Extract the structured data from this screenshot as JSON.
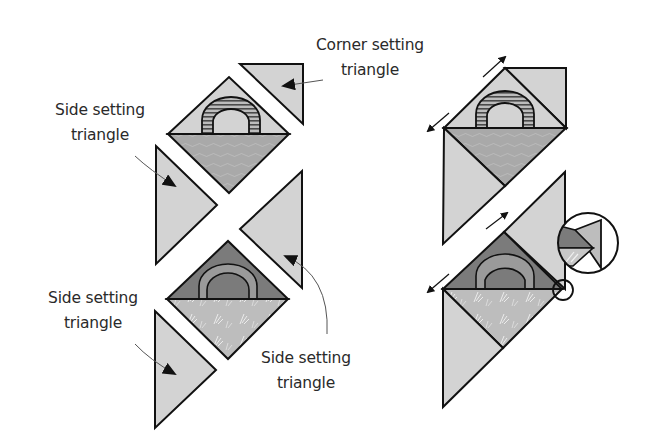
{
  "diagram": {
    "type": "quilt-assembly",
    "colors": {
      "setting_triangle": "#d3d3d3",
      "woodgrain_fabric": "#a9a9a9",
      "dark_fabric": "#7b7b7b",
      "floral_fabric": "#bdbdbd",
      "outline": "#111111",
      "arch_stripe": "#555555",
      "leader_line": "#555555"
    },
    "labels": {
      "corner_top": {
        "line1": "Corner setting",
        "line2": "triangle"
      },
      "side_upper_left": {
        "line1": "Side setting",
        "line2": "triangle"
      },
      "side_lower_left": {
        "line1": "Side setting",
        "line2": "triangle"
      },
      "side_lower_right": {
        "line1": "Side setting",
        "line2": "triangle"
      }
    },
    "panels": [
      {
        "name": "exploded-layout",
        "pieces": [
          "corner setting triangle",
          "appliqued arch block (woodgrain)",
          "side setting triangle",
          "side setting triangle",
          "appliqued arch block (floral)",
          "side setting triangle"
        ]
      },
      {
        "name": "sewn-rows",
        "notes": [
          "seam direction arrows",
          "detail magnifier showing dog-ear alignment"
        ]
      }
    ]
  }
}
